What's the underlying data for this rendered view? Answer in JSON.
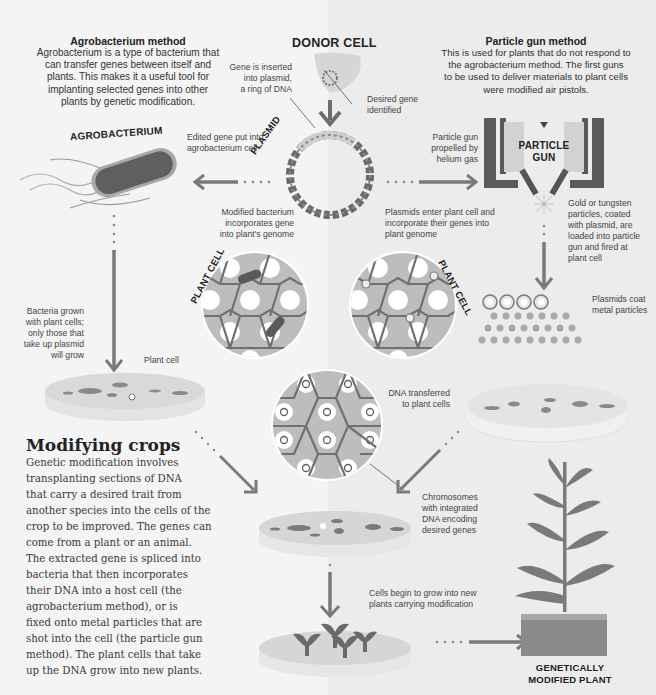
{
  "agrobacterium_method": {
    "title": "Agrobacterium method",
    "body_lines": [
      "Agrobacterium is a type of bacterium that",
      "can transfer genes between itself and",
      "plants. This makes it a useful tool for",
      "implanting selected genes into other",
      "plants by genetic modification."
    ]
  },
  "particle_gun_method": {
    "title": "Particle gun method",
    "body_lines": [
      "This is used for plants that do not respond to",
      "the agrobacterium method. The first guns",
      "to be used to deliver materials to plant cells",
      "were modified air pistols."
    ]
  },
  "donor_cell": {
    "title": "DONOR CELL",
    "gene_inserted_lines": [
      "Gene is inserted",
      "into plasmid,",
      "a ring of DNA"
    ],
    "desired_gene_lines": [
      "Desired gene",
      "identified"
    ]
  },
  "plasmid": {
    "label": "PLASMID"
  },
  "agrobacterium": {
    "label": "AGROBACTERIUM",
    "edited_gene_lines": [
      "Edited gene put into",
      "agrobacterium cell"
    ]
  },
  "particle_gun": {
    "label_lines": [
      "PARTICLE",
      "GUN"
    ],
    "propelled_lines": [
      "Particle gun",
      "propelled by",
      "helium gas"
    ],
    "particles_lines": [
      "Gold or tungsten",
      "particles, coated",
      "with plasmid, are",
      "loaded into particle",
      "gun and fired at",
      "plant cell"
    ],
    "plasmids_coat_lines": [
      "Plasmids coat",
      "metal particles"
    ]
  },
  "plant_cell_left": {
    "label": "PLANT CELL",
    "modified_bacterium_lines": [
      "Modified bacterium",
      "incorporates gene",
      "into plant's genome"
    ]
  },
  "plant_cell_right": {
    "label": "PLANT CELL",
    "plasmids_enter_lines": [
      "Plasmids enter plant cell and",
      "incorporate their genes into",
      "plant genome"
    ]
  },
  "dish_left": {
    "bacteria_grown_lines": [
      "Bacteria grown",
      "with plant cells;",
      "only those that",
      "take up plasmid",
      "will grow"
    ],
    "plant_cell_label": "Plant cell"
  },
  "dish_right": {
    "dna_transferred_lines": [
      "DNA transferred",
      "to plant cells"
    ]
  },
  "center": {
    "chromosomes_lines": [
      "Chromosomes",
      "with integrated",
      "DNA encoding",
      "desired genes"
    ],
    "cells_grow_lines": [
      "Cells begin to grow into new",
      "plants carrying modification"
    ]
  },
  "result": {
    "label_lines": [
      "GENETICALLY",
      "MODIFIED PLANT"
    ]
  },
  "modifying_crops": {
    "title": "Modifying crops",
    "body_lines": [
      "Genetic modification involves",
      "transplanting sections of DNA",
      "that carry a desired trait from",
      "another species into the cells of the",
      "crop to be improved. The genes can",
      "come from a plant or an animal.",
      "The extracted gene is spliced into",
      "bacteria that then incorporates",
      "their DNA into a host cell (the",
      "agrobacterium method), or is",
      "fixed onto metal particles that are",
      "shot into the cell (the particle gun",
      "method). The plant cells that take",
      "up the DNA grow into new plants."
    ]
  },
  "colors": {
    "dark": "#5a5a5a",
    "mid": "#8a8a8a",
    "light": "#c4c4c4",
    "cell_fill": "#bdbdbd",
    "cell_wall": "#707070",
    "arrow": "#7a7a7a"
  }
}
